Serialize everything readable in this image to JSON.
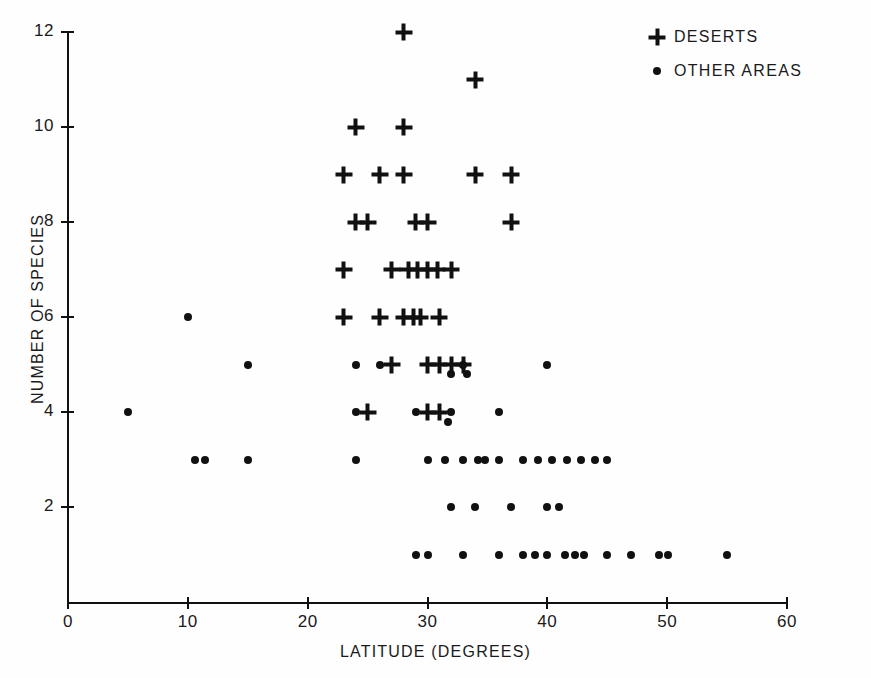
{
  "chart_data": {
    "type": "scatter",
    "title": "",
    "xlabel": "LATITUDE (DEGREES)",
    "ylabel": "NUMBER OF SPECIES",
    "xlim": [
      0,
      60
    ],
    "ylim": [
      0,
      12
    ],
    "xticks": [
      0,
      10,
      20,
      30,
      40,
      50,
      60
    ],
    "yticks": [
      2,
      4,
      6,
      8,
      10,
      12
    ],
    "xticklabels": [
      "0",
      "10",
      "20",
      "30",
      "40",
      "50",
      "60"
    ],
    "yticklabels": [
      "2",
      "4",
      "6",
      "8",
      "10",
      "12"
    ],
    "grid": false,
    "legend_position": "top-right",
    "series": [
      {
        "name": "DESERTS",
        "marker": "plus",
        "color": "#111111",
        "points": [
          [
            28,
            12
          ],
          [
            34,
            11
          ],
          [
            24,
            10
          ],
          [
            28,
            10
          ],
          [
            23,
            9
          ],
          [
            26,
            9
          ],
          [
            28,
            9
          ],
          [
            34,
            9
          ],
          [
            37,
            9
          ],
          [
            24,
            8
          ],
          [
            25,
            8
          ],
          [
            29,
            8
          ],
          [
            30,
            8
          ],
          [
            37,
            8
          ],
          [
            23,
            7
          ],
          [
            27,
            7
          ],
          [
            28.4,
            7
          ],
          [
            29.2,
            7
          ],
          [
            30,
            7
          ],
          [
            30.8,
            7
          ],
          [
            32,
            7
          ],
          [
            23,
            6
          ],
          [
            26,
            6
          ],
          [
            28,
            6
          ],
          [
            28.8,
            6
          ],
          [
            29.4,
            6
          ],
          [
            31,
            6
          ],
          [
            30,
            5
          ],
          [
            31,
            5
          ],
          [
            32,
            5
          ],
          [
            33,
            5
          ],
          [
            27,
            5
          ],
          [
            25,
            4
          ],
          [
            30,
            4
          ],
          [
            31,
            4
          ]
        ]
      },
      {
        "name": "OTHER AREAS",
        "marker": "dot",
        "color": "#111111",
        "points": [
          [
            5,
            4
          ],
          [
            10,
            6
          ],
          [
            15,
            5
          ],
          [
            10.6,
            3
          ],
          [
            11.4,
            3
          ],
          [
            15,
            3
          ],
          [
            24,
            5
          ],
          [
            26,
            5
          ],
          [
            33,
            5
          ],
          [
            40,
            5
          ],
          [
            32,
            4.8
          ],
          [
            33.3,
            4.8
          ],
          [
            24,
            4
          ],
          [
            29,
            4
          ],
          [
            32,
            4
          ],
          [
            31.7,
            3.8
          ],
          [
            36,
            4
          ],
          [
            24,
            3
          ],
          [
            30,
            3
          ],
          [
            31.5,
            3
          ],
          [
            33,
            3
          ],
          [
            34.2,
            3
          ],
          [
            34.8,
            3
          ],
          [
            36,
            3
          ],
          [
            38,
            3
          ],
          [
            39.2,
            3
          ],
          [
            40.4,
            3
          ],
          [
            41.6,
            3
          ],
          [
            42.8,
            3
          ],
          [
            44,
            3
          ],
          [
            45,
            3
          ],
          [
            32,
            2
          ],
          [
            34,
            2
          ],
          [
            37,
            2
          ],
          [
            40,
            2
          ],
          [
            41,
            2
          ],
          [
            29,
            1
          ],
          [
            30,
            1
          ],
          [
            33,
            1
          ],
          [
            36,
            1
          ],
          [
            38,
            1
          ],
          [
            39,
            1
          ],
          [
            40,
            1
          ],
          [
            41.5,
            1
          ],
          [
            42.3,
            1
          ],
          [
            43.1,
            1
          ],
          [
            45,
            1
          ],
          [
            47,
            1
          ],
          [
            49.3,
            1
          ],
          [
            50.1,
            1
          ],
          [
            55,
            1
          ]
        ]
      }
    ]
  },
  "legend": {
    "items": [
      {
        "label": "DESERTS",
        "marker": "plus"
      },
      {
        "label": "OTHER AREAS",
        "marker": "dot"
      }
    ]
  }
}
